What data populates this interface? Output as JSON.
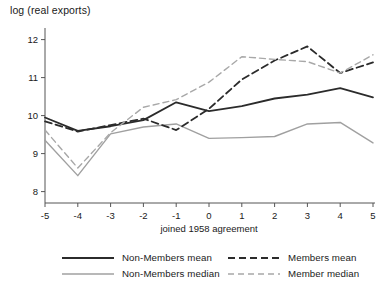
{
  "chart_data": {
    "type": "line",
    "title": "",
    "ylabel": "log (real exports)",
    "xlabel": "joined 1958 agreement",
    "x": [
      -5,
      -4,
      -3,
      -2,
      -1,
      0,
      1,
      2,
      3,
      4,
      5
    ],
    "xticklabels": [
      "-5",
      "-4",
      "-3",
      "-2",
      "-1",
      "0",
      "1",
      "2",
      "3",
      "4",
      "5"
    ],
    "yticks": [
      8,
      9,
      10,
      11,
      12
    ],
    "yticklabels": [
      "8",
      "9",
      "10",
      "11",
      "12"
    ],
    "xlim": [
      -5,
      5
    ],
    "ylim": [
      7.7,
      12.2
    ],
    "grid": false,
    "legend_position": "below",
    "series": [
      {
        "name": "Non-Members mean",
        "style": "solid",
        "color": "#2b2b2b",
        "width": 1.8,
        "values": [
          9.95,
          9.6,
          9.72,
          9.88,
          10.35,
          10.12,
          10.25,
          10.45,
          10.55,
          10.72,
          10.48
        ]
      },
      {
        "name": "Non-Members median",
        "style": "solid",
        "color": "#a0a0a0",
        "width": 1.4,
        "values": [
          9.35,
          8.42,
          9.52,
          9.7,
          9.78,
          9.4,
          9.42,
          9.45,
          9.78,
          9.82,
          9.28
        ]
      },
      {
        "name": "Members mean",
        "style": "dashed",
        "color": "#2b2b2b",
        "width": 1.8,
        "values": [
          9.85,
          9.58,
          9.75,
          9.92,
          9.62,
          10.18,
          10.95,
          11.45,
          11.82,
          11.12,
          11.4
        ]
      },
      {
        "name": "Member median",
        "style": "dashed",
        "color": "#a8a8a8",
        "width": 1.4,
        "values": [
          9.62,
          8.62,
          9.55,
          10.22,
          10.42,
          10.88,
          11.55,
          11.48,
          11.42,
          11.12,
          11.6
        ]
      }
    ]
  },
  "legend": {
    "entries": [
      {
        "label": "Non-Members mean"
      },
      {
        "label": "Members mean"
      },
      {
        "label": "Non-Members median"
      },
      {
        "label": "Member median"
      }
    ]
  }
}
